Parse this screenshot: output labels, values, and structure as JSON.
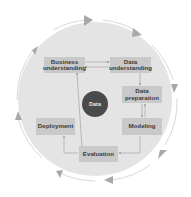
{
  "diagram": {
    "title": "",
    "center": {
      "label": "Data"
    },
    "phases": [
      {
        "id": "business",
        "label": "Business understanding"
      },
      {
        "id": "data_understanding",
        "label": "Data understanding"
      },
      {
        "id": "data_preparation",
        "label": "Data preparation"
      },
      {
        "id": "modeling",
        "label": "Modeling"
      },
      {
        "id": "evaluation",
        "label": "Evaluation"
      },
      {
        "id": "deployment",
        "label": "Deployment"
      }
    ],
    "edges": [
      {
        "from": "business",
        "to": "data_understanding"
      },
      {
        "from": "data_understanding",
        "to": "business"
      },
      {
        "from": "data_understanding",
        "to": "data_preparation"
      },
      {
        "from": "data_preparation",
        "to": "modeling"
      },
      {
        "from": "modeling",
        "to": "data_preparation"
      },
      {
        "from": "modeling",
        "to": "evaluation"
      },
      {
        "from": "evaluation",
        "to": "business"
      },
      {
        "from": "evaluation",
        "to": "deployment"
      }
    ],
    "outer_cycle": {
      "direction": "clockwise",
      "arrow_count": 8
    },
    "colors": {
      "disc": "#e4e4e4",
      "box": "#c9c9c9",
      "center": "#4a4a4a",
      "arrows": "#a8a8a8"
    }
  }
}
